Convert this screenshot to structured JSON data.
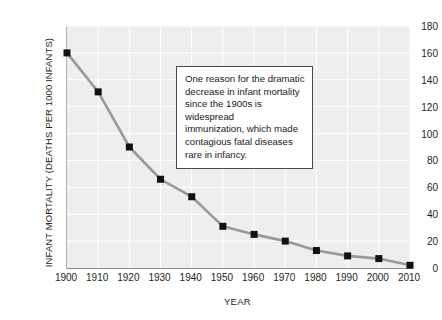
{
  "chart_data": {
    "type": "line",
    "title": "",
    "xlabel": "YEAR",
    "ylabel": "INFANT MORTALITY (DEATHS PER 1000 INFANTS)",
    "x": [
      1900,
      1910,
      1920,
      1930,
      1940,
      1950,
      1960,
      1970,
      1980,
      1990,
      2000,
      2010
    ],
    "values": [
      160,
      131,
      90,
      66,
      53,
      31,
      25,
      20,
      13,
      9,
      7,
      2
    ],
    "categories": [
      "1900",
      "1910",
      "1920",
      "1930",
      "1940",
      "1950",
      "1960",
      "1970",
      "1980",
      "1990",
      "2000",
      "2010"
    ],
    "xlim": [
      1900,
      2010
    ],
    "ylim": [
      0,
      180
    ],
    "ytick_labels": [
      "0",
      "20",
      "40",
      "60",
      "80",
      "100",
      "120",
      "140",
      "160",
      "180"
    ],
    "ytick_values": [
      0,
      20,
      40,
      60,
      80,
      100,
      120,
      140,
      160,
      180
    ],
    "xtick_labels": [
      "1900",
      "1910",
      "1920",
      "1930",
      "1940",
      "1950",
      "1960",
      "1970",
      "1980",
      "1990",
      "2000",
      "2010"
    ],
    "grid": true,
    "legend": "none",
    "line_color": "#9a9a9a",
    "marker_color": "#111111",
    "marker_shape": "square",
    "plot_background": "#eeeeee",
    "gridline_color": "#ffffff",
    "annotations": [
      {
        "text": "One reason for the dramatic decrease in infant mortality since the 1900s is widespread immunization, which made contagious fatal diseases rare in infancy.",
        "lines": [
          "One reason for the dramatic",
          "decrease in infant mortality",
          "since the 1900s is widespread",
          "immunization, which made",
          "contagious fatal diseases",
          "rare in infancy."
        ]
      }
    ]
  }
}
